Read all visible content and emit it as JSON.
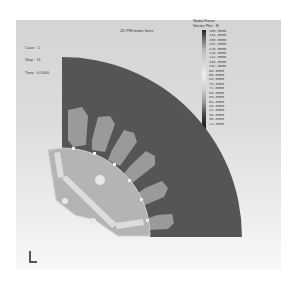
{
  "plot": {
    "title": "2D PM motor force",
    "info": {
      "case": "Case : 1",
      "step": "Step : 11",
      "time": "Time : 0.0000"
    }
  },
  "legend": {
    "title_line1": "Nodal Force",
    "title_line2": "Vector Plot : N",
    "values": [
      "150.0000",
      "144.0000",
      "138.0000",
      "132.0000",
      "126.0000",
      "120.0000",
      "114.0000",
      "108.0000",
      "102.0000",
      "96.0000",
      "90.0000",
      "84.0000",
      "78.0000",
      "72.0000",
      "66.0000",
      "60.0000",
      "54.0000",
      "48.0000",
      "42.0000",
      "36.0000",
      "30.0000",
      "24.0000"
    ]
  },
  "colors": {
    "stator": "#555555",
    "slot": "#9a9a9a",
    "rotor": "#b4b4b4",
    "magnet": "#dcdcdc"
  }
}
